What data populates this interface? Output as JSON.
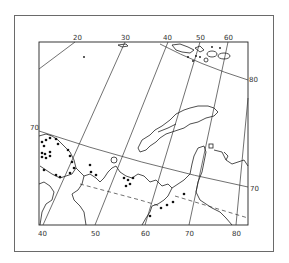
{
  "map": {
    "frame": {
      "outer": [
        14,
        15,
        274,
        252
      ],
      "inner": [
        39,
        42,
        248,
        225
      ]
    },
    "colors": {
      "line": "#222222",
      "frame": "#6a6a6a",
      "background": "#ffffff",
      "dots": "#111111"
    },
    "top_longitude_labels": [
      {
        "text": "20",
        "x": 77,
        "y": 40
      },
      {
        "text": "30",
        "x": 125,
        "y": 40
      },
      {
        "text": "40",
        "x": 168,
        "y": 40
      },
      {
        "text": "50",
        "x": 201,
        "y": 40
      },
      {
        "text": "60",
        "x": 228,
        "y": 40
      }
    ],
    "bottom_longitude_labels": [
      {
        "text": "40",
        "x": 42,
        "y": 236
      },
      {
        "text": "50",
        "x": 95,
        "y": 236
      },
      {
        "text": "60",
        "x": 145,
        "y": 236
      },
      {
        "text": "70",
        "x": 189,
        "y": 236
      },
      {
        "text": "80",
        "x": 236,
        "y": 236
      }
    ],
    "latitude_labels": [
      {
        "text": "80",
        "x": 249,
        "y": 80
      },
      {
        "text": "70",
        "x": 30,
        "y": 128
      },
      {
        "text": "70",
        "x": 251,
        "y": 191
      }
    ],
    "features": {
      "region": "Barents and Kara Sea region with Novaya Zemlya",
      "graticule": "latitude/longitude grid lines",
      "markers": "black dots indicating observation locations"
    }
  }
}
